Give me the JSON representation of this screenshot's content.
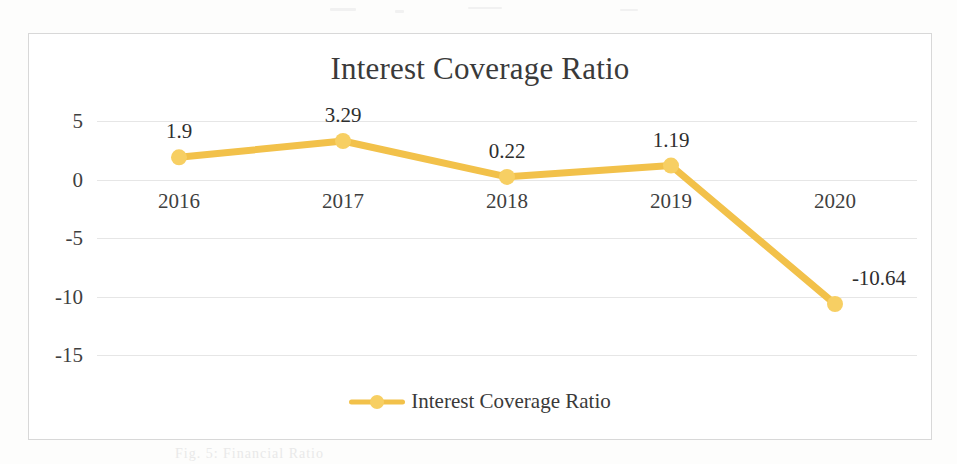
{
  "chart_data": {
    "type": "line",
    "title": "Interest Coverage Ratio",
    "xlabel": "",
    "ylabel": "",
    "categories": [
      "2016",
      "2017",
      "2018",
      "2019",
      "2020"
    ],
    "values": [
      1.9,
      3.29,
      0.22,
      1.19,
      -10.64
    ],
    "point_labels": [
      "1.9",
      "3.29",
      "0.22",
      "1.19",
      "-10.64"
    ],
    "series": [
      {
        "name": "Interest Coverage Ratio",
        "values": [
          1.9,
          3.29,
          0.22,
          1.19,
          -10.64
        ],
        "color": "#f2c14a"
      }
    ],
    "ylim": [
      -15,
      5
    ],
    "yticks": [
      5,
      0,
      -5,
      -10,
      -15
    ],
    "ytick_labels": [
      "5",
      "0",
      "-5",
      "-10",
      "-15"
    ],
    "grid": true,
    "legend": {
      "position": "bottom",
      "entries": [
        "Interest Coverage Ratio"
      ]
    },
    "colors": {
      "series": "#f2c14a",
      "marker": "#f7cf63",
      "gridline": "#e6e6e6",
      "frame": "#d8d8d8",
      "text": "#3f3f3f"
    }
  },
  "legend": {
    "label": "Interest Coverage Ratio"
  },
  "caption": {
    "text": "Fig. 5: Financial Ratio"
  }
}
